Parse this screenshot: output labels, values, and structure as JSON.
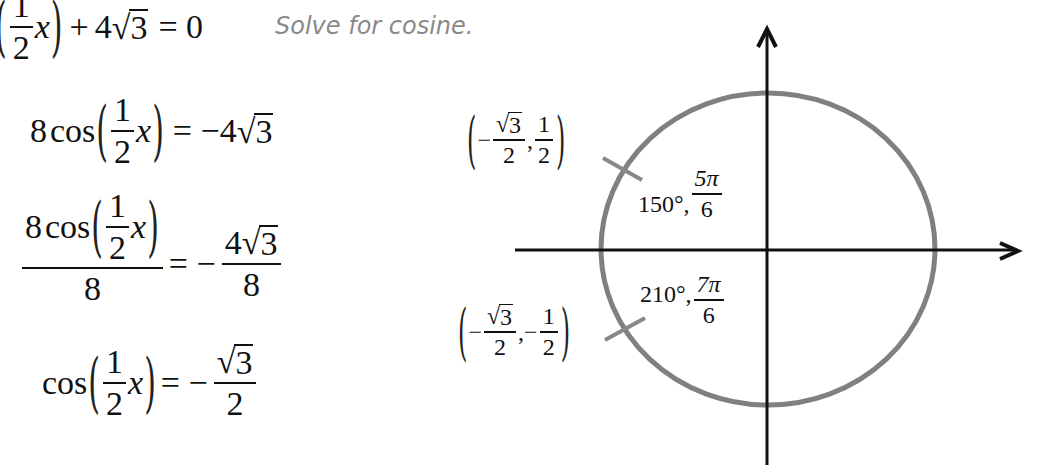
{
  "instruction": "Solve for cosine.",
  "steps": [
    {
      "id": "line1",
      "left": "8cos((1/2)x) + 4√3 = 0",
      "lhs_fraction": {
        "num": "1",
        "den": "2"
      },
      "variable": "x",
      "op": "+",
      "coef": "4",
      "radicand": "3",
      "rhs": "= 0"
    },
    {
      "id": "line2",
      "coef": "8",
      "func": "cos",
      "fraction": {
        "num": "1",
        "den": "2"
      },
      "variable": "x",
      "rhs_sign": "= −4",
      "radicand": "3"
    },
    {
      "id": "line3",
      "num_coef": "8",
      "func": "cos",
      "fraction": {
        "num": "1",
        "den": "2"
      },
      "variable": "x",
      "den": "8",
      "eq": "= −",
      "rhs_num_coef": "4",
      "radicand": "3",
      "rhs_den": "8"
    },
    {
      "id": "line4",
      "func": "cos",
      "fraction": {
        "num": "1",
        "den": "2"
      },
      "variable": "x",
      "eq": "= −",
      "radicand": "3",
      "rhs_den": "2"
    }
  ],
  "unit_circle": {
    "axes": {
      "x_arrow": true,
      "y_arrow": true
    },
    "circle_color": "#808080",
    "axis_color": "#111111",
    "points": [
      {
        "coord_x_sign": "−",
        "coord_x_radicand": "3",
        "coord_x_den": "2",
        "coord_y_sign": "",
        "coord_y_num": "1",
        "coord_y_den": "2",
        "degrees": "150°,",
        "radians_num": "5π",
        "radians_den": "6"
      },
      {
        "coord_x_sign": "−",
        "coord_x_radicand": "3",
        "coord_x_den": "2",
        "coord_y_sign": "−",
        "coord_y_num": "1",
        "coord_y_den": "2",
        "degrees": "210°,",
        "radians_num": "7π",
        "radians_den": "6"
      }
    ]
  }
}
